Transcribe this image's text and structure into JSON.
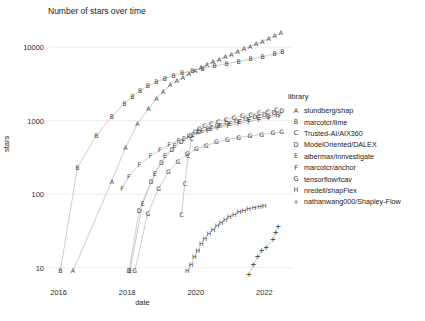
{
  "chart_data": {
    "type": "scatter",
    "title": "Number of stars over time",
    "xlabel": "date",
    "ylabel": "stars",
    "yscale": "log",
    "ylim": [
      6,
      22000
    ],
    "xlim": [
      2015.75,
      2022.6
    ],
    "grid": true,
    "legend_title": "library",
    "legend_position": "right",
    "yticks": [
      10,
      100,
      1000,
      10000
    ],
    "ytick_labels": [
      "10",
      "100",
      "1000",
      "10000"
    ],
    "xticks": [
      2016,
      2018,
      2020,
      2022
    ],
    "xtick_labels": [
      "2016",
      "2018",
      "2020",
      "2022"
    ],
    "series": [
      {
        "key": "A",
        "name": "slundberg/shap",
        "marker": "A",
        "points": [
          [
            2016.42,
            9
          ],
          [
            2017.55,
            150
          ],
          [
            2017.95,
            430
          ],
          [
            2018.3,
            900
          ],
          [
            2018.62,
            1450
          ],
          [
            2018.85,
            2000
          ],
          [
            2019.05,
            2500
          ],
          [
            2019.25,
            3050
          ],
          [
            2019.45,
            3500
          ],
          [
            2019.62,
            3900
          ],
          [
            2019.8,
            4350
          ],
          [
            2019.98,
            4800
          ],
          [
            2020.15,
            5300
          ],
          [
            2020.32,
            5800
          ],
          [
            2020.5,
            6300
          ],
          [
            2020.68,
            6800
          ],
          [
            2020.86,
            7400
          ],
          [
            2021.04,
            8000
          ],
          [
            2021.22,
            8700
          ],
          [
            2021.4,
            9400
          ],
          [
            2021.58,
            10200
          ],
          [
            2021.76,
            11000
          ],
          [
            2021.94,
            12000
          ],
          [
            2022.12,
            13000
          ],
          [
            2022.3,
            14200
          ],
          [
            2022.48,
            15500
          ]
        ]
      },
      {
        "key": "B",
        "name": "marcotcr/lime",
        "marker": "B",
        "points": [
          [
            2016.05,
            9
          ],
          [
            2016.55,
            230
          ],
          [
            2017.1,
            620
          ],
          [
            2017.55,
            1150
          ],
          [
            2017.92,
            1700
          ],
          [
            2018.15,
            2150
          ],
          [
            2018.38,
            2550
          ],
          [
            2018.6,
            2950
          ],
          [
            2018.85,
            3350
          ],
          [
            2019.1,
            3750
          ],
          [
            2019.35,
            4100
          ],
          [
            2019.6,
            4450
          ],
          [
            2019.9,
            4800
          ],
          [
            2020.2,
            5150
          ],
          [
            2020.55,
            5550
          ],
          [
            2020.9,
            5950
          ],
          [
            2021.25,
            6400
          ],
          [
            2021.6,
            6900
          ],
          [
            2021.95,
            7400
          ],
          [
            2022.3,
            8100
          ],
          [
            2022.52,
            8600
          ]
        ]
      },
      {
        "key": "C",
        "name": "Trusted-AI/AIX360",
        "marker": "C",
        "points": [
          [
            2019.58,
            52
          ],
          [
            2019.68,
            140
          ],
          [
            2019.78,
            330
          ],
          [
            2019.88,
            560
          ],
          [
            2019.98,
            700
          ],
          [
            2020.1,
            790
          ],
          [
            2020.25,
            850
          ],
          [
            2020.45,
            920
          ],
          [
            2020.65,
            980
          ],
          [
            2020.88,
            1040
          ],
          [
            2021.1,
            1100
          ],
          [
            2021.35,
            1160
          ],
          [
            2021.6,
            1220
          ],
          [
            2021.85,
            1280
          ],
          [
            2022.1,
            1340
          ],
          [
            2022.35,
            1400
          ]
        ]
      },
      {
        "key": "D",
        "name": "ModelOriented/DALEX",
        "marker": "D",
        "points": [
          [
            2018.05,
            9
          ],
          [
            2018.35,
            60
          ],
          [
            2018.7,
            150
          ],
          [
            2019.0,
            270
          ],
          [
            2019.3,
            400
          ],
          [
            2019.58,
            520
          ],
          [
            2019.85,
            620
          ],
          [
            2020.1,
            700
          ],
          [
            2020.35,
            780
          ],
          [
            2020.62,
            860
          ],
          [
            2020.9,
            930
          ],
          [
            2021.18,
            1000
          ],
          [
            2021.45,
            1070
          ],
          [
            2021.72,
            1140
          ],
          [
            2022.0,
            1220
          ],
          [
            2022.28,
            1300
          ],
          [
            2022.5,
            1370
          ]
        ]
      },
      {
        "key": "E",
        "name": "albermax/innvestigate",
        "marker": "E",
        "points": [
          [
            2018.08,
            9
          ],
          [
            2018.45,
            75
          ],
          [
            2018.8,
            190
          ],
          [
            2019.1,
            330
          ],
          [
            2019.38,
            460
          ],
          [
            2019.65,
            560
          ],
          [
            2019.92,
            640
          ],
          [
            2020.18,
            720
          ],
          [
            2020.45,
            790
          ],
          [
            2020.72,
            850
          ],
          [
            2021.0,
            910
          ],
          [
            2021.28,
            970
          ],
          [
            2021.55,
            1030
          ],
          [
            2021.82,
            1090
          ],
          [
            2022.1,
            1150
          ],
          [
            2022.38,
            1210
          ]
        ]
      },
      {
        "key": "F",
        "name": "marcotcr/anchor",
        "marker": "F",
        "points": [
          [
            2017.85,
            120
          ],
          [
            2018.05,
            175
          ],
          [
            2018.35,
            250
          ],
          [
            2018.68,
            330
          ],
          [
            2018.95,
            400
          ],
          [
            2019.22,
            470
          ],
          [
            2019.5,
            540
          ],
          [
            2019.78,
            610
          ],
          [
            2020.05,
            680
          ],
          [
            2020.35,
            740
          ],
          [
            2020.65,
            800
          ],
          [
            2020.95,
            860
          ],
          [
            2021.25,
            920
          ],
          [
            2021.55,
            980
          ],
          [
            2021.85,
            1040
          ],
          [
            2022.15,
            1100
          ],
          [
            2022.45,
            1160
          ]
        ]
      },
      {
        "key": "G",
        "name": "tensorflow/tcav",
        "marker": "G",
        "points": [
          [
            2018.22,
            9
          ],
          [
            2018.6,
            55
          ],
          [
            2018.92,
            120
          ],
          [
            2019.2,
            200
          ],
          [
            2019.48,
            280
          ],
          [
            2019.75,
            350
          ],
          [
            2020.02,
            410
          ],
          [
            2020.3,
            460
          ],
          [
            2020.6,
            510
          ],
          [
            2020.92,
            550
          ],
          [
            2021.25,
            590
          ],
          [
            2021.58,
            620
          ],
          [
            2021.92,
            650
          ],
          [
            2022.25,
            680
          ],
          [
            2022.5,
            700
          ]
        ]
      },
      {
        "key": "H",
        "name": "nredell/shapFlex",
        "marker": "H",
        "points": [
          [
            2019.75,
            9
          ],
          [
            2019.86,
            11
          ],
          [
            2019.96,
            14
          ],
          [
            2020.06,
            17
          ],
          [
            2020.16,
            21
          ],
          [
            2020.26,
            25
          ],
          [
            2020.38,
            29
          ],
          [
            2020.5,
            33
          ],
          [
            2020.62,
            37
          ],
          [
            2020.74,
            41
          ],
          [
            2020.86,
            45
          ],
          [
            2020.98,
            49
          ],
          [
            2021.12,
            53
          ],
          [
            2021.26,
            57
          ],
          [
            2021.4,
            60
          ],
          [
            2021.54,
            63
          ],
          [
            2021.7,
            66
          ],
          [
            2021.86,
            68
          ],
          [
            2022.0,
            70
          ]
        ]
      },
      {
        "key": "I",
        "name": "nathanwang000/Shapley-Flow",
        "marker": "+",
        "points": [
          [
            2021.55,
            8
          ],
          [
            2021.68,
            11
          ],
          [
            2021.8,
            14
          ],
          [
            2021.92,
            17
          ],
          [
            2022.05,
            19
          ],
          [
            2022.25,
            24
          ],
          [
            2022.33,
            30
          ],
          [
            2022.4,
            36
          ]
        ]
      }
    ]
  },
  "axes": {
    "title": "Number of stars over time",
    "xlabel": "date",
    "ylabel": "stars",
    "ytick_labels": [
      "10000",
      "1000",
      "100",
      "10"
    ],
    "xtick_labels": [
      "2016",
      "2018",
      "2020",
      "2022"
    ]
  },
  "legend": {
    "title": "library",
    "items": [
      {
        "key": "A",
        "label": "slundberg/shap"
      },
      {
        "key": "B",
        "label": "marcotcr/lime"
      },
      {
        "key": "C",
        "label": "Trusted-AI/AIX360"
      },
      {
        "key": "D",
        "label": "ModelOriented/DALEX"
      },
      {
        "key": "E",
        "label": "albermax/innvestigate"
      },
      {
        "key": "F",
        "label": "marcotcr/anchor"
      },
      {
        "key": "G",
        "label": "tensorflow/tcav"
      },
      {
        "key": "H",
        "label": "nredell/shapFlex"
      },
      {
        "key": "I",
        "label": "nathanwang000/Shapley-Flow"
      }
    ]
  },
  "colors": {
    "background": "#ffffff",
    "text": "#1a1a1a",
    "grid": "#e8e8e8",
    "marker": "#3a3a3a",
    "line": "#b8b8b8"
  }
}
